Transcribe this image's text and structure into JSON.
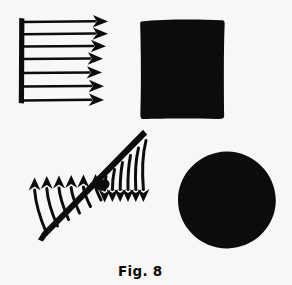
{
  "figure": {
    "caption": "Fig. 8",
    "background_color": "#f8f7f5",
    "ink_color": "#0d0c0c",
    "panels": [
      {
        "id": "uniform-pressure-arrows",
        "name": "uniform-load-arrow-array",
        "description": "Vertical bar on the left with seven equal horizontal arrows pointing right",
        "arrow_count": 7
      },
      {
        "id": "filled-square",
        "name": "solid-square-shape",
        "description": "Solid black square"
      },
      {
        "id": "diagonal-curved-arrows",
        "name": "inclined-bar-curved-arrow-array",
        "description": "Inclined bar with curved arrows sweeping up on the upper-left side and down on the lower-right side",
        "upper_arrow_count": 6,
        "lower_arrow_count": 6
      },
      {
        "id": "filled-circle",
        "name": "solid-circle-shape",
        "description": "Solid black circle"
      }
    ]
  }
}
